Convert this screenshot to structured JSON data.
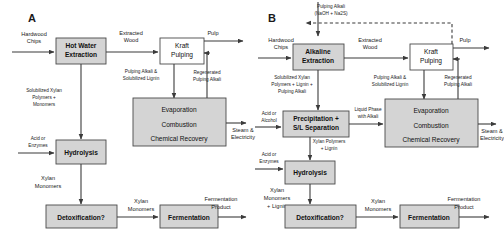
{
  "figure": {
    "panels": [
      {
        "letter": "A",
        "boxes": [
          {
            "name": "hot-water-extraction",
            "label_lines": [
              "Hot Water",
              "Extraction"
            ],
            "bold": true,
            "shaded": true
          },
          {
            "name": "kraft-pulping",
            "label_lines": [
              "Kraft",
              "Pulping"
            ],
            "bold": false,
            "shaded": false
          },
          {
            "name": "evaporation-combustion-chemical-recovery",
            "label_lines": [
              "Evaporation",
              "Combustion",
              "Chemical Recovery"
            ],
            "bold": false,
            "shaded": true
          },
          {
            "name": "hydrolysis",
            "label_lines": [
              "Hydrolysis"
            ],
            "bold": true,
            "shaded": true
          },
          {
            "name": "detoxification",
            "label_lines": [
              "Detoxification?"
            ],
            "bold": true,
            "shaded": true
          },
          {
            "name": "fermentation",
            "label_lines": [
              "Fermentation"
            ],
            "bold": true,
            "shaded": true
          }
        ],
        "streams": [
          {
            "name": "hardwood-chips",
            "lines": [
              "Hardwood",
              "Chips"
            ]
          },
          {
            "name": "extracted-wood",
            "lines": [
              "Extracted",
              "Wood"
            ]
          },
          {
            "name": "pulp",
            "lines": [
              "Pulp"
            ]
          },
          {
            "name": "pulping-alkali-solubilized-lignin",
            "lines": [
              "Pulping Alkali  &",
              "Solubilized Lignin"
            ]
          },
          {
            "name": "regenerated-pulping-alkali",
            "lines": [
              "Regenerated",
              "Pulping Alkali"
            ]
          },
          {
            "name": "solubilized-xylan-polymers-monomers",
            "lines": [
              "Solubilized Xylan",
              "Polymers +",
              "Monomers"
            ]
          },
          {
            "name": "acid-or-enzymes",
            "lines": [
              "Acid or",
              "Enzymes"
            ]
          },
          {
            "name": "steam-electricity",
            "lines": [
              "Steam &",
              "Electricity"
            ]
          },
          {
            "name": "xylan-monomers-from-hydrolysis",
            "lines": [
              "Xylan",
              "Monomers"
            ]
          },
          {
            "name": "xylan-monomers-to-fermentation",
            "lines": [
              "Xylan",
              "Monomers"
            ]
          },
          {
            "name": "fermentation-product",
            "lines": [
              "Fermentation",
              "Product"
            ]
          }
        ]
      },
      {
        "letter": "B",
        "boxes": [
          {
            "name": "alkaline-extraction",
            "label_lines": [
              "Alkaline",
              "Extraction"
            ],
            "bold": true,
            "shaded": true
          },
          {
            "name": "kraft-pulping",
            "label_lines": [
              "Kraft",
              "Pulping"
            ],
            "bold": false,
            "shaded": false
          },
          {
            "name": "evaporation-combustion-chemical-recovery",
            "label_lines": [
              "Evaporation",
              "Combustion",
              "Chemical Recovery"
            ],
            "bold": false,
            "shaded": true
          },
          {
            "name": "precipitation-sl-separation",
            "label_lines": [
              "Precipitation +",
              "S/L Separation"
            ],
            "bold": true,
            "shaded": true
          },
          {
            "name": "hydrolysis",
            "label_lines": [
              "Hydrolysis"
            ],
            "bold": true,
            "shaded": true
          },
          {
            "name": "detoxification",
            "label_lines": [
              "Detoxification?"
            ],
            "bold": true,
            "shaded": true
          },
          {
            "name": "fermentation",
            "label_lines": [
              "Fermentation"
            ],
            "bold": true,
            "shaded": true
          }
        ],
        "streams": [
          {
            "name": "pulping-alkali-feed",
            "lines": [
              "Pulping Alkali",
              "(NaOH + Na2S)"
            ]
          },
          {
            "name": "hardwood-chips",
            "lines": [
              "Hardwood",
              "Chips"
            ]
          },
          {
            "name": "extracted-wood",
            "lines": [
              "Extracted",
              "Wood"
            ]
          },
          {
            "name": "pulp",
            "lines": [
              "Pulp"
            ]
          },
          {
            "name": "pulping-alkali-solubilized-lignin",
            "lines": [
              "Pulping Alkali  &",
              "Solubilized Lignin"
            ]
          },
          {
            "name": "regenerated-pulping-alkali",
            "lines": [
              "Regenerated",
              "Pulping Alkali"
            ]
          },
          {
            "name": "solubilized-xylan-polymers-lignin-alkali",
            "lines": [
              "Solubilized Xylan",
              "Polymers + Lignin +",
              "Pulping Alkali"
            ]
          },
          {
            "name": "acid-or-alcohol",
            "lines": [
              "Acid or",
              "Alcohol"
            ]
          },
          {
            "name": "liquid-phase-with-alkali",
            "lines": [
              "Liquid Phase",
              "with Alkali"
            ]
          },
          {
            "name": "xylan-polymers-lignin",
            "lines": [
              "Xylan Polymers",
              "+ Lignin"
            ]
          },
          {
            "name": "acid-or-enzymes",
            "lines": [
              "Acid or",
              "Enzymes"
            ]
          },
          {
            "name": "steam-electricity",
            "lines": [
              "Steam &",
              "Electricity"
            ]
          },
          {
            "name": "xylan-monomers-lignin",
            "lines": [
              "Xylan",
              "Monomers",
              "+ Lignin"
            ]
          },
          {
            "name": "xylan-monomers-to-fermentation",
            "lines": [
              "Xylan",
              "Monomers"
            ]
          },
          {
            "name": "fermentation-product",
            "lines": [
              "Fermentation",
              "Product"
            ]
          }
        ]
      }
    ],
    "colors": {
      "shaded_box_fill": "#d4d4d4",
      "white_box_fill": "#ffffff",
      "box_stroke": "#4a4a4a",
      "flow_line": "#3b3b3b",
      "text": "#1a1a1a",
      "background": "#ffffff"
    }
  }
}
